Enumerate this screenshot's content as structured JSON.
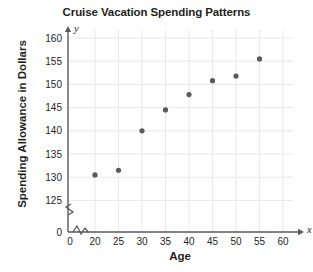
{
  "chart_data": {
    "type": "scatter",
    "title": "Cruise Vacation Spending Patterns",
    "xlabel": "Age",
    "ylabel": "Spending Allowance in Dollars",
    "x_axis_symbol": "x",
    "y_axis_symbol": "y",
    "xlim": [
      0,
      60
    ],
    "ylim": [
      120,
      160
    ],
    "x_break_after": 0,
    "y_break_after": 0,
    "grid": true,
    "x_ticks": [
      0,
      20,
      25,
      30,
      35,
      40,
      45,
      50,
      55,
      60
    ],
    "x_tick_labels": [
      "0",
      "20",
      "25",
      "30",
      "35",
      "40",
      "45",
      "50",
      "55",
      "60"
    ],
    "y_ticks": [
      0,
      125,
      130,
      135,
      140,
      145,
      150,
      155,
      160
    ],
    "y_tick_labels": [
      "0",
      "125",
      "130",
      "135",
      "140",
      "145",
      "150",
      "155",
      "160"
    ],
    "origin_label": "0",
    "points": [
      {
        "x": 20,
        "y": 130.5
      },
      {
        "x": 25,
        "y": 131.5
      },
      {
        "x": 30,
        "y": 140.0
      },
      {
        "x": 35,
        "y": 144.5
      },
      {
        "x": 40,
        "y": 147.8
      },
      {
        "x": 45,
        "y": 150.8
      },
      {
        "x": 50,
        "y": 151.8
      },
      {
        "x": 55,
        "y": 155.5
      }
    ],
    "point_color": "#5a5a5a",
    "axis_color": "#58595b",
    "grid_color": "#e8e8ec",
    "text_color": "#231f20",
    "legend": null,
    "annotations": []
  }
}
